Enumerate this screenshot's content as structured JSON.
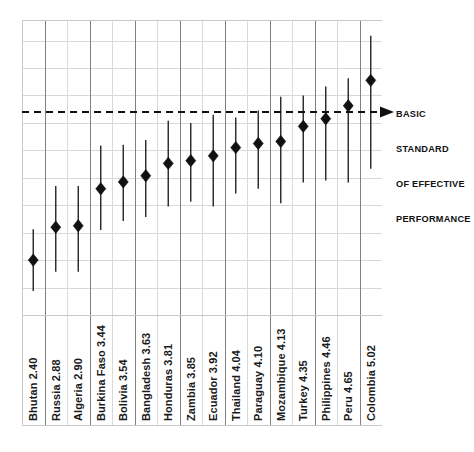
{
  "chart_data": {
    "type": "scatter",
    "title": "",
    "subtitle": "",
    "xlabel": "",
    "ylabel": "",
    "grid": true,
    "legend_position": "none",
    "orientation": "vertical-error-bars",
    "ylim": [
      1.6,
      5.9
    ],
    "categories": [
      "Bhutan",
      "Russia",
      "Algeria",
      "Burkina Faso",
      "Bolivia",
      "Bangladesh",
      "Honduras",
      "Zambia",
      "Ecuador",
      "Thailand",
      "Paraguay",
      "Mozambique",
      "Turkey",
      "Philippines",
      "Peru",
      "Colombia"
    ],
    "values": [
      2.4,
      2.88,
      2.9,
      3.44,
      3.54,
      3.63,
      3.81,
      3.85,
      3.92,
      4.04,
      4.1,
      4.13,
      4.35,
      4.46,
      4.65,
      5.02
    ],
    "tick_labels": [
      "Bhutan  2.40",
      "Russia  2.88",
      "Algeria  2.90",
      "Burkina Faso  3.44",
      "Bolivia  3.54",
      "Bangladesh  3.63",
      "Honduras  3.81",
      "Zambia  3.85",
      "Ecuador  3.92",
      "Thailand  4.04",
      "Paraguay  4.10",
      "Mozambique  4.13",
      "Turkey  4.35",
      "Philippines  4.46",
      "Peru  4.65",
      "Colombia  5.02"
    ],
    "error_low": [
      1.95,
      2.23,
      2.23,
      2.84,
      2.97,
      3.03,
      3.18,
      3.25,
      3.18,
      3.37,
      3.44,
      3.23,
      3.53,
      3.56,
      3.53,
      3.73
    ],
    "error_high": [
      2.85,
      3.48,
      3.48,
      4.07,
      4.08,
      4.15,
      4.43,
      4.4,
      4.52,
      4.48,
      4.58,
      4.78,
      4.8,
      4.93,
      5.05,
      5.67
    ],
    "threshold": {
      "value": 4.72,
      "style": "dashed",
      "label_lines": [
        "BASIC",
        "STANDARD",
        "OF EFFECTIVE",
        "PERFORMANCE"
      ],
      "arrow": "left-pointing-arrow"
    },
    "colors": {
      "marker": "#111111",
      "errorbar": "#242424",
      "threshold": "#111111",
      "gridline": "#d8d8d8",
      "gridline_strong": "#808080",
      "frame": "#c9c9c9",
      "background": "#ffffff",
      "label_text": "#1a1a1a"
    },
    "gridlines_y": [
      2.0,
      2.4,
      2.8,
      3.2,
      3.6,
      4.0,
      4.4,
      4.8,
      5.2,
      5.6
    ],
    "column_divider_weights": [
      "light",
      "dark",
      "light",
      "dark",
      "light",
      "dark",
      "light",
      "dark",
      "light",
      "dark",
      "light",
      "dark",
      "light",
      "dark",
      "light",
      "dark"
    ]
  },
  "annotation": {
    "line1": "BASIC",
    "line2": "STANDARD",
    "line3": "OF EFFECTIVE",
    "line4": "PERFORMANCE"
  }
}
